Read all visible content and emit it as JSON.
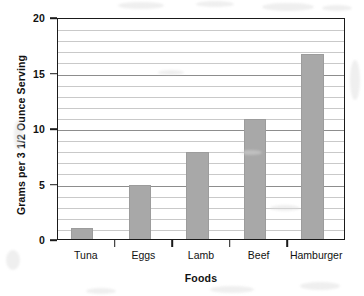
{
  "chart_data": {
    "type": "bar",
    "title": "",
    "subtitle": "",
    "xlabel": "Foods",
    "ylabel": "Grams per 3 1/2 Ounce Serving",
    "categories": [
      "Tuna",
      "Eggs",
      "Lamb",
      "Beef",
      "Hamburger"
    ],
    "values": [
      1,
      4.9,
      7.8,
      10.8,
      16.7
    ],
    "series": [
      {
        "name": "Fat content",
        "values": [
          1,
          4.9,
          7.8,
          10.8,
          16.7
        ]
      }
    ],
    "ylim": [
      0,
      20
    ],
    "y_major_ticks": [
      0,
      5,
      10,
      15,
      20
    ],
    "y_major_tick_labels": [
      "0",
      "5",
      "10",
      "15",
      "20"
    ],
    "y_minor_tick_step": 1,
    "grid": "horizontal",
    "grid_minor": true,
    "legend": null,
    "legend_position": "none",
    "annotations": [],
    "bar_color": "#a8a8a8",
    "bar_edge_color": "#9c9c9c",
    "axis_color": "#1a1a1a",
    "gridline_color": "#c9c9c9",
    "gridline_major_color": "#8d8d8d",
    "background_color": "#ffffff"
  }
}
